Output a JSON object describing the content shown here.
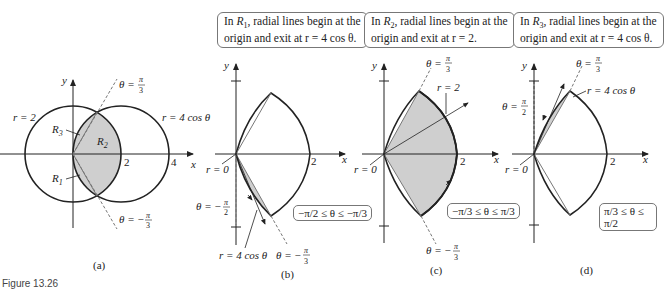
{
  "figure": {
    "caption": "Figure 13.26",
    "panels": [
      {
        "id": "a",
        "label": "(a)",
        "curves": [
          "r = 2",
          "r = 4 cos θ"
        ],
        "regions": [
          "R1",
          "R2",
          "R3"
        ],
        "rays": [
          "θ = π/3",
          "θ = −π/3"
        ],
        "x_ticks": [
          "2",
          "4"
        ],
        "axes": {
          "x": "x",
          "y": "y"
        }
      },
      {
        "id": "b",
        "label": "(b)",
        "note": "In R1, radial lines begin at the origin and exit at r = 4 cos θ.",
        "note_line1_prefix": "In ",
        "note_region": "R",
        "note_region_sub": "1",
        "note_line1_suffix": ", radial lines begin at the",
        "note_line2": "origin and exit at r = 4 cos θ.",
        "labels": [
          "r = 0",
          "θ = −π/2",
          "r = 4 cos θ",
          "θ = −π/3"
        ],
        "range": "−π/2 ≤ θ ≤ −π/3",
        "x_ticks": [
          "2"
        ]
      },
      {
        "id": "c",
        "label": "(c)",
        "note": "In R2, radial lines begin at the origin and exit at r = 2.",
        "note_line1_prefix": "In ",
        "note_region": "R",
        "note_region_sub": "2",
        "note_line1_suffix": ", radial lines begin at the",
        "note_line2": "origin and exit at r = 2.",
        "labels": [
          "θ = π/3",
          "r = 2",
          "r = 0",
          "θ = −π/3"
        ],
        "range": "−π/3 ≤ θ ≤ π/3",
        "x_ticks": [
          "2"
        ]
      },
      {
        "id": "d",
        "label": "(d)",
        "note": "In R3, radial lines begin at the origin and exit at r = 4 cos θ.",
        "note_line1_prefix": "In ",
        "note_region": "R",
        "note_region_sub": "3",
        "note_line1_suffix": ", radial lines begin at the",
        "note_line2": "origin and exit at r = 4 cos θ.",
        "labels": [
          "θ = π/3",
          "r = 4 cos θ",
          "θ = π/2",
          "r = 0"
        ],
        "range": "π/3 ≤ θ ≤ π/2",
        "x_ticks": [
          "2"
        ]
      }
    ]
  },
  "text": {
    "x": "x",
    "y": "y",
    "r2": "r = 2",
    "r4cos": "r = 4 cos θ",
    "r0": "r = 0",
    "two": "2",
    "four": "4",
    "R": "R",
    "s1": "1",
    "s2": "2",
    "s3": "3",
    "theta_eq": "θ = ",
    "theta_eq_neg": "θ = −",
    "pi": "π",
    "three": "3",
    "twoden": "2",
    "label_a": "(a)",
    "label_b": "(b)",
    "label_c": "(c)",
    "label_d": "(d)",
    "range_b": "−π/2 ≤ θ ≤ −π/3",
    "range_c": "−π/3 ≤ θ ≤ π/3",
    "range_d": "π/3 ≤ θ ≤ π/2"
  },
  "colors": {
    "shade": "#cfcfcf",
    "stroke": "#222222",
    "box_border": "#777777"
  }
}
